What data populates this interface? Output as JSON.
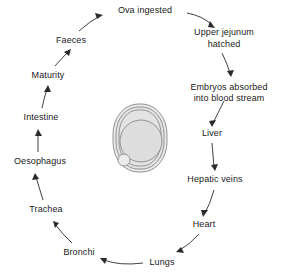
{
  "diagram": {
    "type": "cycle",
    "background_color": "#ffffff",
    "text_color": "#1a1a1a",
    "arrow_color": "#2b2b2b",
    "nodes": [
      {
        "id": "ova",
        "label": "Ova ingested",
        "x": 145,
        "y": 11,
        "lines": [
          "Ova ingested"
        ]
      },
      {
        "id": "jejunum",
        "label": "Upper jejunum hatched",
        "x": 224,
        "y": 38,
        "lines": [
          "Upper jejunum",
          "hatched"
        ]
      },
      {
        "id": "embryos",
        "label": "Embryos absorbed into blood stream",
        "x": 229,
        "y": 88,
        "lines": [
          "Embryos absorbed",
          "into blood stream"
        ]
      },
      {
        "id": "liver",
        "label": "Liver",
        "x": 212,
        "y": 134,
        "lines": [
          "Liver"
        ]
      },
      {
        "id": "hepatic",
        "label": "Hepatic veins",
        "x": 215,
        "y": 180,
        "lines": [
          "Hepatic veins"
        ]
      },
      {
        "id": "heart",
        "label": "Heart",
        "x": 204,
        "y": 225,
        "lines": [
          "Heart"
        ]
      },
      {
        "id": "lungs",
        "label": "Lungs",
        "x": 162,
        "y": 262,
        "lines": [
          "Lungs"
        ]
      },
      {
        "id": "bronchi",
        "label": "Bronchi",
        "x": 79,
        "y": 253,
        "lines": [
          "Bronchi"
        ]
      },
      {
        "id": "trachea",
        "label": "Trachea",
        "x": 46,
        "y": 210,
        "lines": [
          "Trachea"
        ]
      },
      {
        "id": "oesophagus",
        "label": "Oesophagus",
        "x": 40,
        "y": 162,
        "lines": [
          "Oesophagus"
        ]
      },
      {
        "id": "intestine",
        "label": "Intestine",
        "x": 41,
        "y": 118,
        "lines": [
          "Intestine"
        ]
      },
      {
        "id": "maturity",
        "label": "Maturity",
        "x": 48,
        "y": 76,
        "lines": [
          "Maturity"
        ]
      },
      {
        "id": "faeces",
        "label": "Faeces",
        "x": 71,
        "y": 41,
        "lines": [
          "Faeces"
        ]
      }
    ],
    "edges": [
      {
        "from": "faeces",
        "to": "ova"
      },
      {
        "from": "ova",
        "to": "jejunum"
      },
      {
        "from": "jejunum",
        "to": "embryos"
      },
      {
        "from": "embryos",
        "to": "liver"
      },
      {
        "from": "liver",
        "to": "hepatic"
      },
      {
        "from": "hepatic",
        "to": "heart"
      },
      {
        "from": "heart",
        "to": "lungs"
      },
      {
        "from": "lungs",
        "to": "bronchi"
      },
      {
        "from": "bronchi",
        "to": "trachea"
      },
      {
        "from": "trachea",
        "to": "oesophagus"
      },
      {
        "from": "oesophagus",
        "to": "intestine"
      },
      {
        "from": "intestine",
        "to": "maturity"
      },
      {
        "from": "maturity",
        "to": "faeces"
      }
    ],
    "center_illustration": {
      "name": "ovum-egg",
      "description": "Oval egg with nested shell layers, inner circular embryo and small vacuole at lower left",
      "shell_color": "#e8e8e8",
      "outline_color": "#8a8a8a",
      "cx": 140,
      "cy": 138
    }
  }
}
